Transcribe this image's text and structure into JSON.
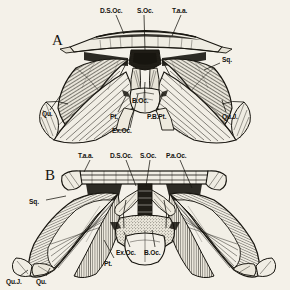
{
  "plate": {
    "background_color": "#f4f1e9",
    "ink_color": "#17150f",
    "description": "Two posterior (occipital) views of a fossil tetrapod skull rendered as engraved line art"
  },
  "figures": [
    {
      "id": "A",
      "letter": "A",
      "caption_letter": "A",
      "labels": [
        {
          "key": "dsoc",
          "text": "D.S.Oc.",
          "x": 100,
          "y": 11
        },
        {
          "key": "soc",
          "text": "S.Oc.",
          "x": 140,
          "y": 11
        },
        {
          "key": "taa",
          "text": "T.a.a.",
          "x": 172,
          "y": 11
        },
        {
          "key": "sq",
          "text": "Sq.",
          "x": 222,
          "y": 60
        },
        {
          "key": "quj",
          "text": "Qu.J.",
          "x": 222,
          "y": 117
        },
        {
          "key": "qu",
          "text": "Qu.",
          "x": 44,
          "y": 114
        },
        {
          "key": "pt",
          "text": "Pt.",
          "x": 113,
          "y": 117
        },
        {
          "key": "exoc",
          "text": "Ex.Oc.",
          "x": 117,
          "y": 131
        },
        {
          "key": "boc",
          "text": "B.Oc.",
          "x": 137,
          "y": 101
        },
        {
          "key": "pbpt",
          "text": "P.B.Pt.",
          "x": 149,
          "y": 117
        }
      ]
    },
    {
      "id": "B",
      "letter": "B",
      "caption_letter": "B",
      "labels": [
        {
          "key": "taa",
          "text": "T.a.a.",
          "x": 80,
          "y": 156
        },
        {
          "key": "dsoc",
          "text": "D.S.Oc.",
          "x": 112,
          "y": 156
        },
        {
          "key": "soc",
          "text": "S.Oc.",
          "x": 142,
          "y": 156
        },
        {
          "key": "paroc",
          "text": "P.a.Oc.",
          "x": 168,
          "y": 156
        },
        {
          "key": "sq",
          "text": "Sq.",
          "x": 31,
          "y": 202
        },
        {
          "key": "exoc",
          "text": "Ex.Oc.",
          "x": 120,
          "y": 253
        },
        {
          "key": "boc",
          "text": "B.Oc.",
          "x": 148,
          "y": 253
        },
        {
          "key": "pt",
          "text": "Pt.",
          "x": 108,
          "y": 264
        },
        {
          "key": "quj",
          "text": "Qu.J.",
          "x": 9,
          "y": 281
        },
        {
          "key": "qu",
          "text": "Qu.",
          "x": 39,
          "y": 281
        }
      ]
    }
  ],
  "legend_terms": {
    "D.S.Oc.": "dorsal supraoccipital",
    "S.Oc.": "supraoccipital",
    "T.a.a.": "tabular",
    "P.a.Oc.": "paroccipital",
    "Ex.Oc.": "exoccipital",
    "B.Oc.": "basioccipital",
    "Pt.": "pterygoid",
    "P.B.Pt.": "posterior basipterygoid",
    "Qu.": "quadrate",
    "Qu.J.": "quadratojugal",
    "Sq.": "squamosal"
  }
}
